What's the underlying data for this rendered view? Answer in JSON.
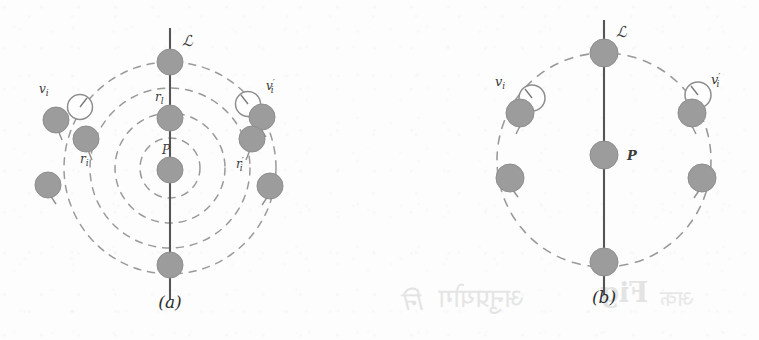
{
  "figure": {
    "kind": "two-panel-geometry-diagram",
    "background_color": "#fdfdfd",
    "node_fill": "#9c9c9c",
    "node_stroke": "#8a8a8a",
    "dash_color": "#9a9a9a",
    "axis_color": "#575757",
    "label_color": "#3a3a3a"
  },
  "panel_a": {
    "caption": "(a)",
    "axis_label": "ℒ",
    "labels": {
      "center_point": "P",
      "axis_node_upper": "rₗ",
      "left_vertex": "vᵢ",
      "left_radius": "rᵢ",
      "right_vertex": "v′ᵢ",
      "right_radius": "r′ᵢ"
    },
    "concentric_circle_count": 4,
    "concentric_radii": [
      30,
      55,
      80,
      106
    ],
    "center": {
      "x": 170,
      "y": 168
    },
    "axis_nodes": [
      {
        "x": 170,
        "y": 62
      },
      {
        "x": 170,
        "y": 118
      },
      {
        "x": 170,
        "y": 170
      },
      {
        "x": 170,
        "y": 265
      }
    ],
    "left_nodes": [
      {
        "x": 56,
        "y": 120
      },
      {
        "x": 86,
        "y": 139
      },
      {
        "x": 48,
        "y": 185
      }
    ],
    "right_nodes": [
      {
        "x": 262,
        "y": 117
      },
      {
        "x": 252,
        "y": 139
      },
      {
        "x": 270,
        "y": 186
      }
    ],
    "clock_markers": [
      {
        "x": 80,
        "y": 107
      },
      {
        "x": 248,
        "y": 104
      }
    ]
  },
  "panel_b": {
    "caption": "(b)",
    "axis_label": "ℒ",
    "labels": {
      "center_point": "P",
      "left_vertex": "vᵢ",
      "right_vertex": "v′ᵢ"
    },
    "concentric_circle_count": 1,
    "concentric_radii": [
      107
    ],
    "center": {
      "x": 224,
      "y": 160
    },
    "axis_nodes": [
      {
        "x": 224,
        "y": 53
      },
      {
        "x": 224,
        "y": 155
      },
      {
        "x": 224,
        "y": 262
      }
    ],
    "left_nodes": [
      {
        "x": 140,
        "y": 113
      },
      {
        "x": 130,
        "y": 178
      }
    ],
    "right_nodes": [
      {
        "x": 312,
        "y": 113
      },
      {
        "x": 322,
        "y": 178
      }
    ],
    "clock_markers": [
      {
        "x": 152,
        "y": 98
      },
      {
        "x": 318,
        "y": 95
      }
    ]
  },
  "bleed_through_text": {
    "fragment_left": "नि",
    "fragment_fig": "Fig",
    "fragment_word": "अनुप्रयोग",
    "fragment_tail": "अक"
  }
}
